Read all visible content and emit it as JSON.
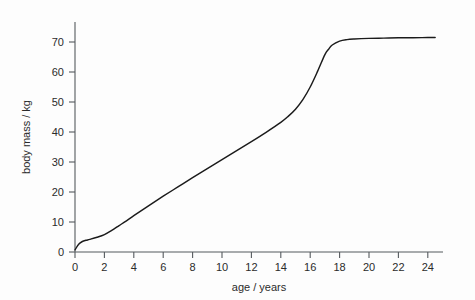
{
  "chart_data": {
    "type": "line",
    "title": "",
    "subtitle": "",
    "xlabel": "age / years",
    "ylabel": "body mass / kg",
    "xlim": [
      0,
      25
    ],
    "ylim": [
      0,
      76
    ],
    "grid": false,
    "legend": null,
    "legend_position": "none",
    "xticks": [
      0,
      2,
      4,
      6,
      8,
      10,
      12,
      14,
      16,
      18,
      20,
      22,
      24
    ],
    "xtick_labels": [
      "0",
      "2",
      "4",
      "6",
      "8",
      "10",
      "12",
      "14",
      "16",
      "18",
      "20",
      "22",
      "24"
    ],
    "yticks": [
      0,
      10,
      20,
      30,
      40,
      50,
      60,
      70
    ],
    "ytick_labels": [
      "0",
      "10",
      "20",
      "30",
      "40",
      "50",
      "60",
      "70"
    ],
    "series": [
      {
        "name": "body mass",
        "color": "#1b1b1b",
        "x": [
          0,
          0.25,
          0.5,
          0.75,
          1,
          1.5,
          2,
          2.5,
          3,
          3.5,
          4,
          5,
          6,
          7,
          8,
          9,
          10,
          11,
          12,
          13,
          14,
          14.5,
          15,
          15.5,
          16,
          16.5,
          17,
          17.25,
          17.5,
          18,
          18.5,
          19,
          20,
          21,
          22,
          23,
          24,
          24.5
        ],
        "y": [
          0.7,
          2.6,
          3.5,
          3.9,
          4.2,
          4.9,
          5.8,
          7.2,
          8.8,
          10.4,
          12.1,
          15.4,
          18.6,
          21.7,
          24.8,
          27.8,
          30.8,
          33.8,
          36.8,
          39.9,
          43.2,
          45.2,
          47.6,
          50.8,
          55.0,
          60.2,
          65.8,
          67.6,
          69.0,
          70.3,
          70.8,
          71.0,
          71.2,
          71.3,
          71.4,
          71.4,
          71.5,
          71.5
        ]
      }
    ],
    "annotations": []
  },
  "axes": {
    "x_axis_title": "age / years",
    "y_axis_title": "body mass / kg"
  }
}
